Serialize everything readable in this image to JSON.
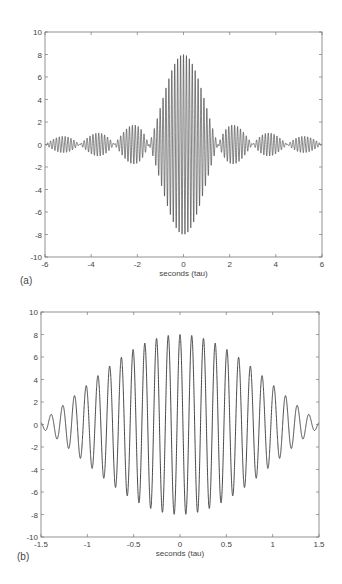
{
  "chart_data": [
    {
      "id": "a",
      "type": "line",
      "panel_label": "(a)",
      "title": "",
      "xlabel": "seconds (tau)",
      "ylabel": "",
      "xlim": [
        -6,
        6
      ],
      "ylim": [
        -10,
        10
      ],
      "xticks": [
        -6,
        -4,
        -2,
        0,
        2,
        4,
        6
      ],
      "yticks": [
        10,
        8,
        6,
        4,
        2,
        0,
        -2,
        -4,
        -6,
        -8,
        -10
      ],
      "grid": false,
      "description": "Amplitude-modulated oscillation: carrier ~7.9 cycles/tau under a sinc-shaped envelope",
      "envelope": {
        "peak": 8,
        "first_zero": 1.5,
        "side_lobe_peaks": [
          {
            "x": -5.4,
            "y": 0.7
          },
          {
            "x": -3.8,
            "y": 1.0
          },
          {
            "x": -2.2,
            "y": 1.7
          },
          {
            "x": 0,
            "y": 8
          },
          {
            "x": 2.2,
            "y": 1.7
          },
          {
            "x": 3.8,
            "y": 1.0
          },
          {
            "x": 5.4,
            "y": 0.7
          }
        ]
      },
      "carrier_freq": 7.9,
      "color": "#333333"
    },
    {
      "id": "b",
      "type": "line",
      "panel_label": "(b)",
      "title": "",
      "xlabel": "seconds (tau)",
      "ylabel": "",
      "xlim": [
        -1.5,
        1.5
      ],
      "ylim": [
        -10,
        10
      ],
      "xticks": [
        -1.5,
        -1,
        -0.5,
        0,
        0.5,
        1,
        1.5
      ],
      "yticks": [
        10,
        8,
        6,
        4,
        2,
        0,
        -2,
        -4,
        -6,
        -8,
        -10
      ],
      "grid": false,
      "description": "Zoom of main lobe of the same signal",
      "envelope": {
        "peak": 8,
        "first_zero": 1.6
      },
      "carrier_freq": 7.9,
      "color": "#333333"
    }
  ]
}
